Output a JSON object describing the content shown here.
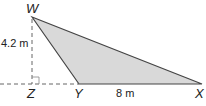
{
  "diagram": {
    "type": "triangle",
    "vertices": {
      "W": {
        "label": "W"
      },
      "X": {
        "label": "X"
      },
      "Y": {
        "label": "Y"
      },
      "Z": {
        "label": "Z"
      }
    },
    "measurements": {
      "height": "4.2 m",
      "base": "8 m"
    },
    "colors": {
      "fill": "#d9d9d9",
      "stroke": "#444444",
      "dashed": "#666666"
    }
  }
}
